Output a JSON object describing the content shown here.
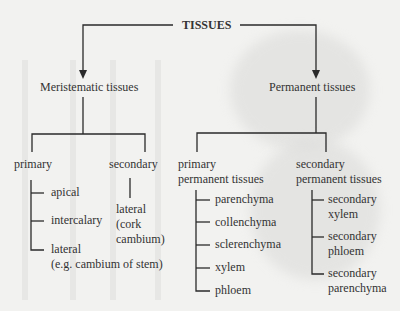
{
  "root": "TISSUES",
  "branches": {
    "meristematic": {
      "label": "Meristematic tissues",
      "primary": {
        "label": "primary",
        "items": [
          "apical",
          "intercalary",
          "lateral",
          "(e.g. cambium of stem)"
        ]
      },
      "secondary": {
        "label": "secondary",
        "items": [
          "lateral",
          "(cork",
          "cambium)"
        ]
      }
    },
    "permanent": {
      "label": "Permanent tissues",
      "primary": {
        "label1": "primary",
        "label2": "permanent tissues",
        "items": [
          "parenchyma",
          "collenchyma",
          "sclerenchyma",
          "xylem",
          "phloem"
        ]
      },
      "secondary": {
        "label1": "secondary",
        "label2": "permanent tissues",
        "items": [
          [
            "secondary",
            "xylem"
          ],
          [
            "secondary",
            "phloem"
          ],
          [
            "secondary",
            "parenchyma"
          ]
        ]
      }
    }
  }
}
